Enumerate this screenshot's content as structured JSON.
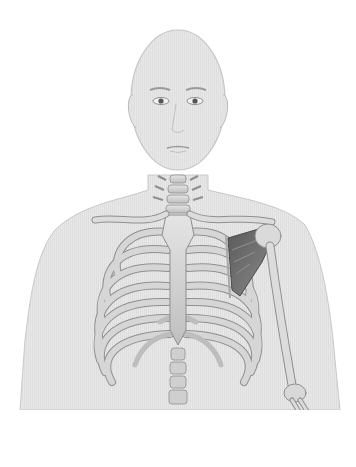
{
  "figure": {
    "title": "Anatomical illustration: human upper body with rib cage, clavicles, spine and left shoulder muscle",
    "highlighted_structure": "subscapularis / shoulder muscle (dark shaded)",
    "colors": {
      "background": "#ffffff",
      "skin": "#e6e6e6",
      "skin_outline": "#c4c4c4",
      "bone": "#d2d2d2",
      "bone_outline": "#8f8f8f",
      "cartilage": "#bdbdbd",
      "muscle": "#6e6e6e",
      "eye": "#555555"
    }
  }
}
